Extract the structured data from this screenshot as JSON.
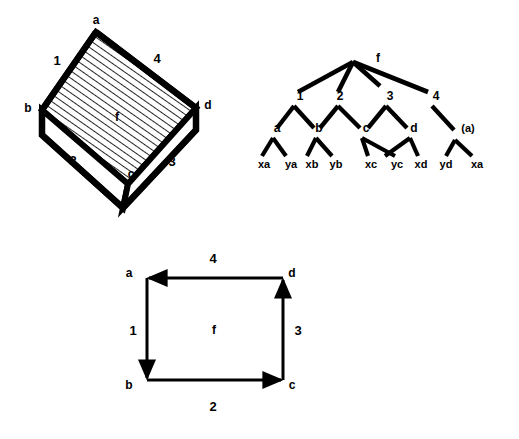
{
  "figure": {
    "caption": "",
    "ink_color": "#000000",
    "background_color": "#ffffff"
  },
  "block_diagram": {
    "name": "3d-hatched-block",
    "face_label": "f",
    "vertices": [
      {
        "id": "a",
        "label": "a",
        "x": 96,
        "y": 32,
        "label_x": 96,
        "label_y": 20
      },
      {
        "id": "b",
        "label": "b",
        "x": 42,
        "y": 110,
        "label_x": 28,
        "label_y": 108
      },
      {
        "id": "c",
        "label": "c",
        "x": 128,
        "y": 184,
        "label_x": 131,
        "label_y": 174
      },
      {
        "id": "d",
        "label": "d",
        "x": 196,
        "y": 108,
        "label_x": 208,
        "label_y": 105
      }
    ],
    "edge_labels": [
      {
        "id": "1",
        "label": "1",
        "x": 57,
        "y": 60
      },
      {
        "id": "2",
        "label": "2",
        "x": 73,
        "y": 160
      },
      {
        "id": "3",
        "label": "3",
        "x": 172,
        "y": 161
      },
      {
        "id": "4",
        "label": "4",
        "x": 157,
        "y": 58
      },
      {
        "id": "f",
        "label": "f",
        "x": 117,
        "y": 117
      }
    ]
  },
  "tree_diagram": {
    "name": "parse-tree",
    "root": {
      "id": "f",
      "label": "f",
      "x": 103,
      "y": 22,
      "label_x": 128,
      "label_y": 18
    },
    "level1": [
      {
        "id": "1",
        "label": "1",
        "x": 44,
        "y": 62,
        "label_x": 50,
        "label_y": 56
      },
      {
        "id": "2",
        "label": "2",
        "x": 88,
        "y": 62,
        "label_x": 90,
        "label_y": 56
      },
      {
        "id": "3",
        "label": "3",
        "x": 136,
        "y": 62,
        "label_x": 140,
        "label_y": 56
      },
      {
        "id": "4",
        "label": "4",
        "x": 182,
        "y": 62,
        "label_x": 186,
        "label_y": 56
      }
    ],
    "level2": [
      {
        "id": "a",
        "label": "a",
        "x": 23,
        "y": 94,
        "label_x": 27,
        "label_y": 88
      },
      {
        "id": "b",
        "label": "b",
        "x": 66,
        "y": 94,
        "label_x": 69,
        "label_y": 88
      },
      {
        "id": "c",
        "label": "c",
        "x": 112,
        "y": 94,
        "label_x": 116,
        "label_y": 88
      },
      {
        "id": "d",
        "label": "d",
        "x": 160,
        "y": 94,
        "label_x": 164,
        "label_y": 88
      },
      {
        "id": "a2",
        "label": "(a)",
        "x": 205,
        "y": 94,
        "label_x": 216,
        "label_y": 88
      }
    ],
    "leaves": [
      {
        "id": "xa1",
        "label": "xa",
        "x": 14,
        "y": 118,
        "label_x": 14,
        "label_y": 122
      },
      {
        "id": "ya",
        "label": "ya",
        "x": 41,
        "y": 118,
        "label_x": 41,
        "label_y": 122
      },
      {
        "id": "xb",
        "label": "xb",
        "x": 62,
        "y": 118,
        "label_x": 62,
        "label_y": 122
      },
      {
        "id": "yb",
        "label": "yb",
        "x": 86,
        "y": 118,
        "label_x": 86,
        "label_y": 122
      },
      {
        "id": "xc",
        "label": "xc",
        "x": 121,
        "y": 118,
        "label_x": 121,
        "label_y": 122
      },
      {
        "id": "yc",
        "label": "yc",
        "x": 147,
        "y": 118,
        "label_x": 147,
        "label_y": 122
      },
      {
        "id": "xd",
        "label": "xd",
        "x": 171,
        "y": 118,
        "label_x": 171,
        "label_y": 122
      },
      {
        "id": "yd",
        "label": "yd",
        "x": 196,
        "y": 118,
        "label_x": 196,
        "label_y": 122
      },
      {
        "id": "xa2",
        "label": "xa",
        "x": 227,
        "y": 118,
        "label_x": 227,
        "label_y": 122
      }
    ]
  },
  "square_diagram": {
    "name": "directed-cycle-square",
    "face_label": "f",
    "corners": [
      {
        "id": "a",
        "label": "a",
        "x": 47,
        "y": 38,
        "label_x": 29,
        "label_y": 33
      },
      {
        "id": "d",
        "label": "d",
        "x": 183,
        "y": 38,
        "label_x": 191,
        "label_y": 33
      },
      {
        "id": "b",
        "label": "b",
        "x": 47,
        "y": 140,
        "label_x": 29,
        "label_y": 144
      },
      {
        "id": "c",
        "label": "c",
        "x": 183,
        "y": 140,
        "label_x": 191,
        "label_y": 144
      }
    ],
    "arrows": [
      {
        "id": "1",
        "label": "1",
        "from": "a",
        "to": "b",
        "direction": "down",
        "label_x": 33,
        "label_y": 90
      },
      {
        "id": "2",
        "label": "2",
        "from": "b",
        "to": "c",
        "direction": "right",
        "label_x": 113,
        "label_y": 164
      },
      {
        "id": "3",
        "label": "3",
        "from": "c",
        "to": "d",
        "direction": "up",
        "label_x": 198,
        "label_y": 90
      },
      {
        "id": "4",
        "label": "4",
        "from": "d",
        "to": "a",
        "direction": "left",
        "label_x": 113,
        "label_y": 18
      }
    ],
    "interior_label": {
      "id": "f",
      "label": "f",
      "x": 114,
      "y": 90
    }
  }
}
